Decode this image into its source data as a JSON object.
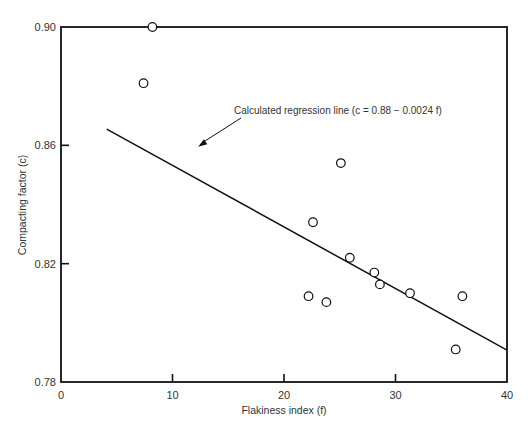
{
  "chart_data": {
    "type": "scatter",
    "title": "",
    "xlabel": "Flakiness index (f)",
    "ylabel": "Compacting factor (c)",
    "xlim": [
      0,
      40
    ],
    "ylim": [
      0.78,
      0.9
    ],
    "x_ticks": [
      0,
      10,
      20,
      30,
      40
    ],
    "x_tick_labels": [
      "0",
      "10",
      "20",
      "30",
      "40"
    ],
    "y_ticks": [
      0.78,
      0.82,
      0.86,
      0.9
    ],
    "y_tick_labels": [
      "0.78",
      "0.82",
      "0.86",
      "0.90"
    ],
    "grid": false,
    "series": [
      {
        "name": "observations",
        "marker": "open-circle",
        "points": [
          {
            "x": 8.2,
            "y": 0.9
          },
          {
            "x": 7.4,
            "y": 0.881
          },
          {
            "x": 25.1,
            "y": 0.854
          },
          {
            "x": 22.6,
            "y": 0.834
          },
          {
            "x": 25.9,
            "y": 0.822
          },
          {
            "x": 28.1,
            "y": 0.817
          },
          {
            "x": 28.6,
            "y": 0.813
          },
          {
            "x": 31.3,
            "y": 0.81
          },
          {
            "x": 36.0,
            "y": 0.809
          },
          {
            "x": 35.4,
            "y": 0.791
          },
          {
            "x": 22.2,
            "y": 0.809
          },
          {
            "x": 23.8,
            "y": 0.807
          }
        ]
      }
    ],
    "regression_line": {
      "label": "Calculated regression line (c = 0.88 − 0.0024 f)",
      "start": {
        "x": 4.1,
        "y": 0.8655
      },
      "end": {
        "x": 40,
        "y": 0.7908
      }
    },
    "annotations": [
      {
        "text": "Calculated regression line (c = 0.88 − 0.0024 f)",
        "anchor_data": {
          "x": 12.3,
          "y": 0.8595
        },
        "arrow": true
      }
    ]
  }
}
